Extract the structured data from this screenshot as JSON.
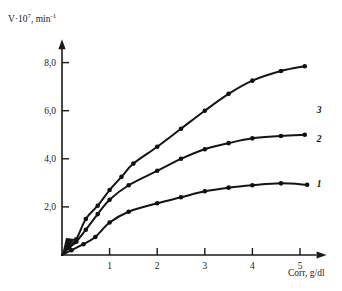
{
  "figure": {
    "background_color": "#ffffff",
    "ink_color": "#141414"
  },
  "chart_data": {
    "type": "line",
    "title": "",
    "subtitle": "",
    "xlabel": "Corr, g/dl",
    "ylabel": "V·10⁷, min⁻¹",
    "ylabel_parts": {
      "base": "V·10",
      "exponent": "7",
      "unit": ", min",
      "unit_exponent": "-1"
    },
    "xlim": [
      0,
      5.6
    ],
    "ylim": [
      0,
      8.8
    ],
    "grid": false,
    "legend_position": "inline-right-of-curve-end",
    "xticks": [
      1,
      2,
      3,
      4,
      5
    ],
    "xtick_labels": [
      "1",
      "2",
      "3",
      "4",
      "5"
    ],
    "yticks": [
      2.0,
      4.0,
      6.0,
      8.0
    ],
    "ytick_labels": [
      "2,0",
      "4,0",
      "6,0",
      "8,0"
    ],
    "decimal_separator": "comma",
    "axis_arrows": true,
    "marker_style": "filled-circle",
    "series": [
      {
        "name": "3",
        "label": "3",
        "label_position": {
          "x": 5.35,
          "y": 6.05
        },
        "x": [
          0.0,
          0.15,
          0.3,
          0.5,
          0.75,
          1.0,
          1.25,
          1.5,
          2.0,
          2.5,
          3.0,
          3.5,
          4.0,
          4.6,
          5.1
        ],
        "y": [
          0.0,
          0.35,
          0.65,
          1.5,
          2.05,
          2.7,
          3.25,
          3.8,
          4.5,
          5.25,
          6.0,
          6.7,
          7.25,
          7.65,
          7.85
        ],
        "values": [
          0.0,
          0.35,
          0.65,
          1.5,
          2.05,
          2.7,
          3.25,
          3.8,
          4.5,
          5.25,
          6.0,
          6.7,
          7.25,
          7.65,
          7.85
        ]
      },
      {
        "name": "2",
        "label": "2",
        "label_position": {
          "x": 5.35,
          "y": 4.85
        },
        "x": [
          0.0,
          0.15,
          0.3,
          0.5,
          0.75,
          1.0,
          1.4,
          2.0,
          2.5,
          3.0,
          3.5,
          4.0,
          4.6,
          5.1
        ],
        "y": [
          0.0,
          0.3,
          0.55,
          1.05,
          1.7,
          2.3,
          2.9,
          3.5,
          4.0,
          4.4,
          4.65,
          4.85,
          4.95,
          5.0
        ],
        "values": [
          0.0,
          0.3,
          0.55,
          1.05,
          1.7,
          2.3,
          2.9,
          3.5,
          4.0,
          4.4,
          4.65,
          4.85,
          4.95,
          5.0
        ]
      },
      {
        "name": "1",
        "label": "1",
        "label_position": {
          "x": 5.35,
          "y": 2.95
        },
        "x": [
          0.0,
          0.2,
          0.45,
          0.7,
          1.0,
          1.4,
          2.0,
          2.5,
          3.0,
          3.5,
          4.0,
          4.6,
          5.15
        ],
        "y": [
          0.0,
          0.2,
          0.45,
          0.75,
          1.35,
          1.8,
          2.15,
          2.4,
          2.65,
          2.8,
          2.9,
          2.98,
          2.92
        ],
        "values": [
          0.0,
          0.2,
          0.45,
          0.75,
          1.35,
          1.8,
          2.15,
          2.4,
          2.65,
          2.8,
          2.9,
          2.98,
          2.92
        ]
      }
    ]
  }
}
